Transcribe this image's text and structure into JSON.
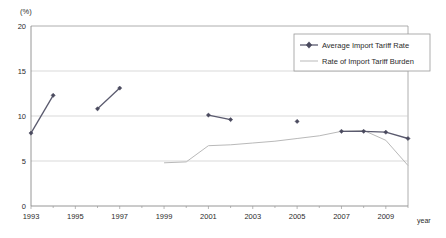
{
  "chart_data": {
    "type": "line",
    "title": "",
    "xlabel": "year",
    "ylabel": "(%)",
    "ylim": [
      0,
      20
    ],
    "xlim": [
      1993,
      2010
    ],
    "yticks": [
      0,
      5,
      10,
      15,
      20
    ],
    "ytick_labels": [
      "0",
      "5",
      "10",
      "15",
      "20"
    ],
    "xticks": [
      1993,
      1995,
      1997,
      1999,
      2001,
      2003,
      2005,
      2007,
      2009
    ],
    "xtick_labels": [
      "1993",
      "1995",
      "1997",
      "1999",
      "2001",
      "2003",
      "2005",
      "2007",
      "2009"
    ],
    "grid": true,
    "grid_axis": "y",
    "legend_position": "top-right",
    "series": [
      {
        "name": "Average Import Tariff Rate",
        "marker": "diamond",
        "color": "#4a4a5e",
        "segments": [
          [
            {
              "x": 1993,
              "y": 8.1
            },
            {
              "x": 1994,
              "y": 12.3
            }
          ],
          [
            {
              "x": 1996,
              "y": 10.8
            },
            {
              "x": 1997,
              "y": 13.1
            }
          ],
          [
            {
              "x": 2001,
              "y": 10.1
            },
            {
              "x": 2002,
              "y": 9.6
            }
          ],
          [
            {
              "x": 2005,
              "y": 9.4
            }
          ],
          [
            {
              "x": 2007,
              "y": 8.3
            },
            {
              "x": 2008,
              "y": 8.3
            },
            {
              "x": 2009,
              "y": 8.2
            },
            {
              "x": 2010,
              "y": 7.5
            }
          ]
        ]
      },
      {
        "name": "Rate of Import Tariff Burden",
        "marker": "none",
        "color": "#b9b9b9",
        "segments": [
          [
            {
              "x": 1999,
              "y": 4.8
            },
            {
              "x": 2000,
              "y": 4.9
            },
            {
              "x": 2001,
              "y": 6.7
            },
            {
              "x": 2002,
              "y": 6.8
            },
            {
              "x": 2003,
              "y": 7.0
            },
            {
              "x": 2004,
              "y": 7.2
            },
            {
              "x": 2005,
              "y": 7.5
            },
            {
              "x": 2006,
              "y": 7.8
            },
            {
              "x": 2007,
              "y": 8.3
            },
            {
              "x": 2008,
              "y": 8.4
            },
            {
              "x": 2009,
              "y": 7.3
            },
            {
              "x": 2010,
              "y": 4.5
            }
          ]
        ]
      }
    ]
  },
  "axes": {
    "y_unit_label": "(%)",
    "x_name_label": "year"
  },
  "legend": {
    "entries": [
      {
        "label": "Average Import Tariff Rate"
      },
      {
        "label": "Rate of Import Tariff Burden"
      }
    ]
  }
}
